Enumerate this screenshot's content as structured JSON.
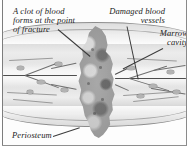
{
  "figure": {
    "style": "grayscale anatomical line illustration",
    "background_color": "#fdfdfd",
    "ink_color": "#1b1b1b"
  },
  "labels": [
    {
      "id": "clot",
      "name": "label-clot",
      "lines": [
        "A clot of blood",
        "forms at the point",
        "of fracture"
      ],
      "align": "left",
      "points_to": "fracture-clot-mass"
    },
    {
      "id": "vessels",
      "name": "label-damaged-blood-vessels",
      "lines": [
        "Damaged blood",
        "vessels"
      ],
      "align": "right",
      "points_to": "torn-vessel-ends"
    },
    {
      "id": "marrow",
      "name": "label-marrow-cavity",
      "lines": [
        "Marrow",
        "cavity"
      ],
      "align": "right",
      "points_to": "marrow-cavity-band"
    },
    {
      "id": "periosteum",
      "name": "label-periosteum",
      "lines": [
        "Periosteum"
      ],
      "align": "left",
      "points_to": "periosteum-sheet"
    }
  ],
  "structures": {
    "clot_mass": "Irregular mottled gray hematoma spanning the fracture gap vertically",
    "bone_shaft": "Horizontally striated cortical bone lamellae on both sides of the fracture",
    "marrow_cavity": "Lighter horizontal band through the center of the shaft",
    "periosteum": "Thin membrane arcing above and below the shaft, lifted around the fracture",
    "blood_vessels": "Dark branching vessels running through bone, torn at the fracture"
  },
  "palette": {
    "ink": "#1b1b1b",
    "vessel": "#4e4e4e",
    "bone_light": "#ededed",
    "bone_mid": "#dedede",
    "clot_gray": "#9b9b9b",
    "frame": "#8a8a8a"
  }
}
